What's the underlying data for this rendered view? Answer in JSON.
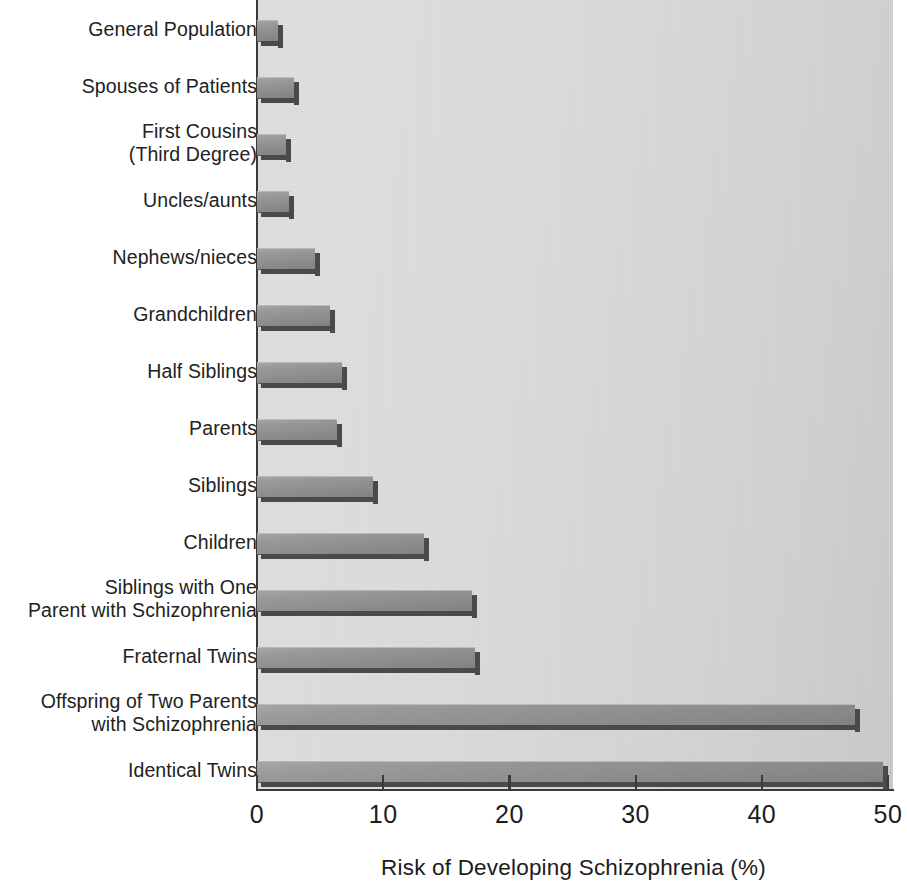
{
  "chart_data": {
    "type": "bar",
    "orientation": "horizontal",
    "title": "",
    "xlabel": "Risk of Developing Schizophrenia (%)",
    "ylabel": "",
    "xlim": [
      0,
      50
    ],
    "xticks": [
      0,
      10,
      20,
      30,
      40,
      50
    ],
    "xtick_labels": [
      "0",
      "10",
      "20",
      "30",
      "40",
      "50"
    ],
    "grid": false,
    "legend": false,
    "categories": [
      "General Population",
      "Spouses of Patients",
      "First Cousins\n(Third Degree)",
      "Uncles/aunts",
      "Nephews/nieces",
      "Grandchildren",
      "Half Siblings",
      "Parents",
      "Siblings",
      "Children",
      "Siblings with One\nParent with Schizophrenia",
      "Fraternal Twins",
      "Offspring of Two Parents\nwith Schizophrenia",
      "Identical Twins"
    ],
    "values": [
      1.7,
      2.9,
      2.3,
      2.5,
      4.6,
      5.8,
      6.7,
      6.3,
      9.2,
      13.2,
      17.0,
      17.3,
      47.4,
      49.6
    ],
    "bars": [
      {
        "label": "General Population",
        "value": 1.7
      },
      {
        "label": "Spouses of Patients",
        "value": 2.9
      },
      {
        "label": "First Cousins (Third Degree)",
        "value": 2.3
      },
      {
        "label": "Uncles/aunts",
        "value": 2.5
      },
      {
        "label": "Nephews/nieces",
        "value": 4.6
      },
      {
        "label": "Grandchildren",
        "value": 5.8
      },
      {
        "label": "Half Siblings",
        "value": 6.7
      },
      {
        "label": "Parents",
        "value": 6.3
      },
      {
        "label": "Siblings",
        "value": 9.2
      },
      {
        "label": "Children",
        "value": 13.2
      },
      {
        "label": "Siblings with One Parent with Schizophrenia",
        "value": 17.0
      },
      {
        "label": "Fraternal Twins",
        "value": 17.3
      },
      {
        "label": "Offspring of Two Parents with Schizophrenia",
        "value": 47.4
      },
      {
        "label": "Identical Twins",
        "value": 49.6
      }
    ],
    "colors": {
      "bar_fill_light": "#a6a6a6",
      "bar_fill_dark": "#828282",
      "bar_shadow": "#4a4a4a",
      "plot_background": "#dcdcdc",
      "axis": "#3a3a3a",
      "text": "#1c1c1c",
      "page_background": "#ffffff"
    }
  }
}
